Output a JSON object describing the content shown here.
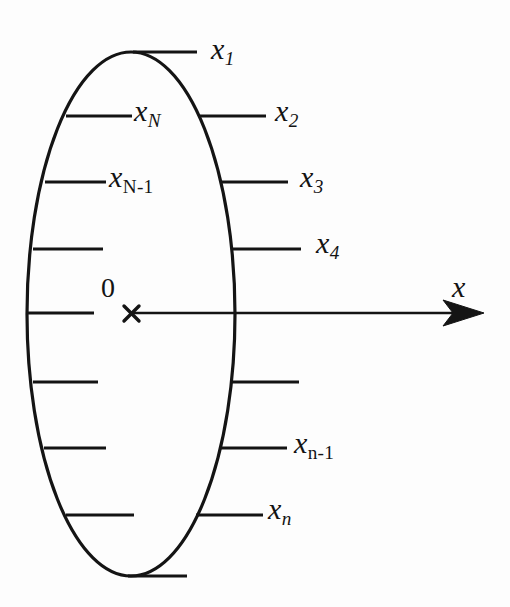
{
  "figure": {
    "kind": "diagram",
    "background_color": "#fdfdfd",
    "stroke_color": "#141414",
    "axis": {
      "label": "x",
      "origin_label": "0",
      "origin_marker": "times-marker",
      "direction": "right",
      "arrowhead": true
    },
    "ellipse": {
      "center_x": 131,
      "center_y": 314,
      "radius_x": 104,
      "radius_y": 262,
      "stroke_width": 3
    },
    "right_ticks": [
      {
        "id": "x1",
        "label_base": "x",
        "label_sub": "1",
        "sub_upright": false,
        "y": 52,
        "x_start": 133,
        "x_end": 197,
        "labelled": true
      },
      {
        "id": "x2",
        "label_base": "x",
        "label_sub": "2",
        "sub_upright": false,
        "y": 116,
        "x_start": 200,
        "x_end": 266,
        "labelled": true
      },
      {
        "id": "x3",
        "label_base": "x",
        "label_sub": "3",
        "sub_upright": false,
        "y": 182,
        "x_start": 221,
        "x_end": 288,
        "labelled": true
      },
      {
        "id": "x4",
        "label_base": "x",
        "label_sub": "4",
        "sub_upright": false,
        "y": 249,
        "x_start": 231,
        "x_end": 301,
        "labelled": true
      },
      {
        "id": "unlabelled-right-1",
        "label_base": "",
        "label_sub": "",
        "sub_upright": false,
        "y": 382,
        "x_start": 231,
        "x_end": 299,
        "labelled": false
      },
      {
        "id": "xn-1",
        "label_base": "x",
        "label_sub": "n-1",
        "sub_upright": true,
        "y": 448,
        "x_start": 221,
        "x_end": 287,
        "labelled": true
      },
      {
        "id": "xn",
        "label_base": "x",
        "label_sub": "n",
        "sub_upright": false,
        "y": 515,
        "x_start": 196,
        "x_end": 263,
        "labelled": true
      }
    ],
    "left_ticks": [
      {
        "id": "xN",
        "label_base": "x",
        "label_sub": "N",
        "sub_upright": false,
        "y": 116,
        "x_start": 66,
        "x_end": 132,
        "labelled": true
      },
      {
        "id": "xN-1",
        "label_base": "x",
        "label_sub": "N-1",
        "sub_upright": true,
        "y": 182,
        "x_start": 45,
        "x_end": 106,
        "labelled": true
      },
      {
        "id": "unlabelled-left-1",
        "label_base": "",
        "label_sub": "",
        "sub_upright": false,
        "y": 249,
        "x_start": 33,
        "x_end": 103,
        "labelled": false
      },
      {
        "id": "unlabelled-left-2",
        "label_base": "",
        "label_sub": "",
        "sub_upright": false,
        "y": 313,
        "x_start": 28,
        "x_end": 94,
        "labelled": false
      },
      {
        "id": "unlabelled-left-3",
        "label_base": "",
        "label_sub": "",
        "sub_upright": false,
        "y": 382,
        "x_start": 33,
        "x_end": 98,
        "labelled": false
      },
      {
        "id": "unlabelled-left-4",
        "label_base": "",
        "label_sub": "",
        "sub_upright": false,
        "y": 448,
        "x_start": 44,
        "x_end": 106,
        "labelled": false
      },
      {
        "id": "unlabelled-left-5",
        "label_base": "",
        "label_sub": "",
        "sub_upright": false,
        "y": 515,
        "x_start": 66,
        "x_end": 134,
        "labelled": false
      },
      {
        "id": "unlabelled-bottom",
        "label_base": "",
        "label_sub": "",
        "sub_upright": false,
        "y": 576,
        "x_start": 128,
        "x_end": 187,
        "labelled": false
      }
    ],
    "labels": {
      "x1": {
        "base": "x",
        "sub": "1"
      },
      "x2": {
        "base": "x",
        "sub": "2"
      },
      "x3": {
        "base": "x",
        "sub": "3"
      },
      "x4": {
        "base": "x",
        "sub": "4"
      },
      "xn_1": {
        "base": "x",
        "sub": "n-1"
      },
      "xn": {
        "base": "x",
        "sub": "n"
      },
      "xN": {
        "base": "x",
        "sub": "N"
      },
      "xN_1": {
        "base": "x",
        "sub": "N-1"
      },
      "axis_x": {
        "base": "x",
        "sub": ""
      },
      "origin": "0"
    }
  }
}
